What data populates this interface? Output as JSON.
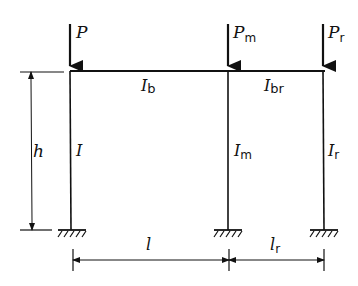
{
  "diagram": {
    "type": "structural-frame",
    "colors": {
      "line": "#111111",
      "background": "#ffffff"
    },
    "loads": [
      {
        "id": "left",
        "symbol": "P",
        "subscript": ""
      },
      {
        "id": "middle",
        "symbol": "P",
        "subscript": "m"
      },
      {
        "id": "right",
        "symbol": "P",
        "subscript": "r"
      }
    ],
    "beams": [
      {
        "id": "left-beam",
        "symbol": "I",
        "subscript": "b"
      },
      {
        "id": "right-beam",
        "symbol": "I",
        "subscript": "br"
      }
    ],
    "columns": [
      {
        "id": "left-column",
        "symbol": "I",
        "subscript": ""
      },
      {
        "id": "middle-column",
        "symbol": "I",
        "subscript": "m"
      },
      {
        "id": "right-column",
        "symbol": "I",
        "subscript": "r"
      }
    ],
    "dimensions": {
      "height": {
        "symbol": "h"
      },
      "left_span": {
        "symbol": "l",
        "subscript": ""
      },
      "right_span": {
        "symbol": "l",
        "subscript": "r"
      }
    },
    "supports": [
      "fixed",
      "fixed",
      "fixed"
    ]
  }
}
